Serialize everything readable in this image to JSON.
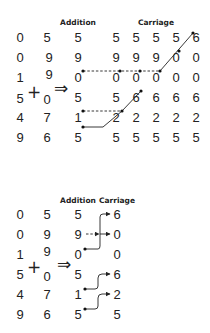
{
  "top_diagram": {
    "headers": {
      "addition": "Addition",
      "carriage": "Carriage"
    },
    "operand_a": [
      "0",
      "0",
      "1",
      "5",
      "4",
      "9"
    ],
    "operand_b": [
      "5",
      "9",
      "9",
      "0",
      "7",
      "6"
    ],
    "plus_sign": "+",
    "implies_sign": "⇒",
    "addition": [
      "5",
      "9",
      "0",
      "5",
      "1",
      "5"
    ],
    "carriage_steps": [
      [
        "5",
        "9",
        "0",
        "5",
        "2",
        "5"
      ],
      [
        "5",
        "9",
        "0",
        "6",
        "2",
        "5"
      ],
      [
        "5",
        "9",
        "0",
        "6",
        "2",
        "5"
      ],
      [
        "5",
        "0",
        "0",
        "6",
        "2",
        "5"
      ],
      [
        "6",
        "0",
        "0",
        "6",
        "2",
        "5"
      ]
    ]
  },
  "bottom_diagram": {
    "headers": {
      "addition": "Addition",
      "carriage": "Carriage"
    },
    "operand_a": [
      "0",
      "0",
      "1",
      "5",
      "4",
      "9"
    ],
    "operand_b": [
      "5",
      "9",
      "9",
      "0",
      "7",
      "6"
    ],
    "plus_sign": "+",
    "implies_sign": "⇒",
    "addition": [
      "5",
      "9",
      "0",
      "5",
      "1",
      "5"
    ],
    "carriage": [
      "6",
      "0",
      "0",
      "6",
      "2",
      "5"
    ]
  }
}
